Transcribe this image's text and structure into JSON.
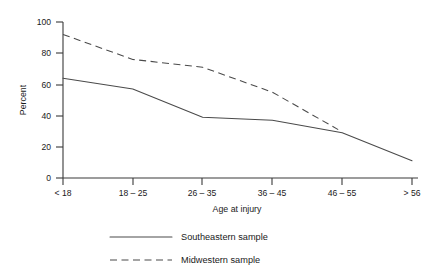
{
  "chart_data": {
    "type": "line",
    "title": "",
    "xlabel": "Age at injury",
    "ylabel": "Percent",
    "categories": [
      "< 18",
      "18 – 25",
      "26 – 35",
      "36 – 45",
      "46 – 55",
      "> 56"
    ],
    "ylim": [
      0,
      100
    ],
    "yticks": [
      0,
      20,
      40,
      60,
      80,
      100
    ],
    "ytick_labels": [
      "0",
      "20",
      "40",
      "60",
      "80",
      "100"
    ],
    "grid": false,
    "legend_position": "below-plot",
    "series": [
      {
        "name": "Southeastern sample",
        "style": "solid",
        "color": "#4a4a4a",
        "values": [
          64,
          57,
          39,
          37,
          29,
          11
        ]
      },
      {
        "name": "Midwestern sample",
        "style": "dashed",
        "color": "#4a4a4a",
        "values": [
          92,
          76,
          71,
          55,
          31,
          null
        ]
      }
    ],
    "annotations": [
      "Midwestern series terminates shortly after crossing the Southeastern series near the 46 – 55 category",
      "Southeastern series bends noticeably between 18 – 25 and 26 – 35 and is nearly flat between 26 – 35 and 36 – 45"
    ]
  },
  "axes": {
    "y_label": "Percent",
    "x_label": "Age at injury",
    "y_ticks": [
      "0",
      "20",
      "40",
      "60",
      "80",
      "100"
    ],
    "x_ticks": [
      "< 18",
      "18 – 25",
      "26 – 35",
      "36 – 45",
      "46 – 55",
      "> 56"
    ]
  },
  "legend": {
    "items": [
      {
        "label": "Southeastern sample",
        "style": "solid"
      },
      {
        "label": "Midwestern sample",
        "style": "dashed"
      }
    ]
  }
}
